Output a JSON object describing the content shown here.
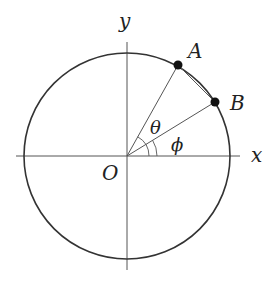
{
  "diagram": {
    "type": "unit-circle-angles",
    "labels": {
      "y_axis": "y",
      "x_axis": "x",
      "origin": "O",
      "point_a": "A",
      "point_b": "B",
      "angle_theta": "θ",
      "angle_phi": "ϕ"
    },
    "colors": {
      "stroke": "#333333",
      "axis": "#555555",
      "point": "#111111",
      "text": "#222222"
    },
    "geometry": {
      "center": [
        127,
        156
      ],
      "radius": 103,
      "point_a": [
        178,
        65
      ],
      "point_b": [
        215,
        102
      ]
    }
  }
}
